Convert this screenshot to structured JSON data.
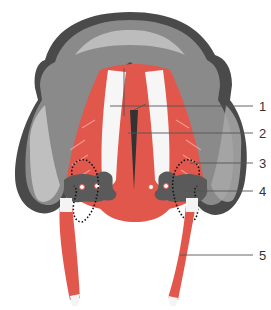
{
  "figure": {
    "type": "anatomical illustration",
    "view": "mandible inferior view with suprahyoid muscles",
    "colors": {
      "bone_dark": "#4a4a4a",
      "bone_mid": "#8a8a8a",
      "bone_light": "#c8c8c8",
      "muscle": "#e2574c",
      "muscle_light": "#f08a80",
      "tendon": "#f4f4f4",
      "leader_line": "#555555",
      "text": "#333333"
    }
  },
  "labels": [
    {
      "id": 1,
      "text": "1",
      "y": 106
    },
    {
      "id": 2,
      "text": "2",
      "y": 133
    },
    {
      "id": 3,
      "text": "3",
      "y": 163
    },
    {
      "id": 4,
      "text": "4",
      "y": 191
    },
    {
      "id": 5,
      "text": "5",
      "y": 255
    }
  ]
}
